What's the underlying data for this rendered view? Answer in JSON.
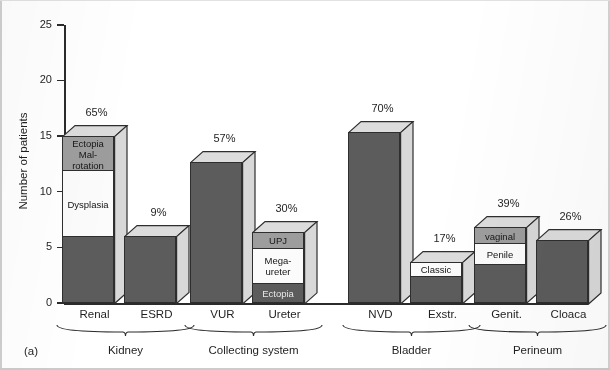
{
  "figure": {
    "panel_label": "(a)",
    "y_axis_title": "Number of patients",
    "y_ticks": [
      "0",
      "5",
      "10",
      "15",
      "20",
      "25"
    ]
  },
  "chart_data": {
    "type": "bar",
    "title": "",
    "subtitle": "",
    "xlabel": "",
    "ylabel": "Number of patients",
    "ylim": [
      0,
      25
    ],
    "ytick_values": [
      0,
      5,
      10,
      15,
      20,
      25
    ],
    "grid": false,
    "legend": "none",
    "style": "3d-stacked-bar",
    "panel": "(a)",
    "groups": [
      {
        "name": "Kidney",
        "categories": [
          "Renal",
          "ESRD"
        ]
      },
      {
        "name": "Collecting system",
        "categories": [
          "VUR",
          "Ureter"
        ]
      },
      {
        "name": "Bladder",
        "categories": [
          "NVD",
          "Exstr."
        ]
      },
      {
        "name": "Perineum",
        "categories": [
          "Genit.",
          "Cloaca"
        ]
      }
    ],
    "categories": [
      "Renal",
      "ESRD",
      "VUR",
      "Ureter",
      "NVD",
      "Exstr.",
      "Genit.",
      "Cloaca"
    ],
    "values": [
      15,
      6,
      12.7,
      6.4,
      15.4,
      3.7,
      6.8,
      5.7
    ],
    "percent_labels": [
      "65%",
      "9%",
      "57%",
      "30%",
      "70%",
      "17%",
      "39%",
      "26%"
    ],
    "bars": [
      {
        "category": "Renal",
        "group": "Kidney",
        "total": 15,
        "percent": "65%",
        "segments": [
          {
            "label": "",
            "value": 6,
            "from": 0,
            "to": 6,
            "fill": "dark"
          },
          {
            "label": "Dysplasia",
            "value": 6,
            "from": 6,
            "to": 12,
            "fill": "white"
          },
          {
            "label": "Ectopia\nMal-\nrotation",
            "value": 3,
            "from": 12,
            "to": 15,
            "fill": "gray"
          }
        ]
      },
      {
        "category": "ESRD",
        "group": "Kidney",
        "total": 6,
        "percent": "9%",
        "segments": [
          {
            "label": "",
            "value": 6,
            "from": 0,
            "to": 6,
            "fill": "dark"
          }
        ]
      },
      {
        "category": "VUR",
        "group": "Collecting system",
        "total": 12.7,
        "percent": "57%",
        "segments": [
          {
            "label": "",
            "value": 12.7,
            "from": 0,
            "to": 12.7,
            "fill": "dark"
          }
        ]
      },
      {
        "category": "Ureter",
        "group": "Collecting system",
        "total": 6.4,
        "percent": "30%",
        "segments": [
          {
            "label": "Ectopia",
            "value": 1.8,
            "from": 0,
            "to": 1.8,
            "fill": "dark"
          },
          {
            "label": "Mega-\nureter",
            "value": 3.2,
            "from": 1.8,
            "to": 5.0,
            "fill": "white"
          },
          {
            "label": "UPJ",
            "value": 1.4,
            "from": 5.0,
            "to": 6.4,
            "fill": "gray"
          }
        ]
      },
      {
        "category": "NVD",
        "group": "Bladder",
        "total": 15.4,
        "percent": "70%",
        "segments": [
          {
            "label": "",
            "value": 15.4,
            "from": 0,
            "to": 15.4,
            "fill": "dark"
          }
        ]
      },
      {
        "category": "Exstr.",
        "group": "Bladder",
        "total": 3.7,
        "percent": "17%",
        "segments": [
          {
            "label": "",
            "value": 2.5,
            "from": 0,
            "to": 2.5,
            "fill": "dark"
          },
          {
            "label": "Classic",
            "value": 1.2,
            "from": 2.5,
            "to": 3.7,
            "fill": "white"
          }
        ]
      },
      {
        "category": "Genit.",
        "group": "Perineum",
        "total": 6.8,
        "percent": "39%",
        "segments": [
          {
            "label": "",
            "value": 3.5,
            "from": 0,
            "to": 3.5,
            "fill": "dark"
          },
          {
            "label": "Penile",
            "value": 1.9,
            "from": 3.5,
            "to": 5.4,
            "fill": "white"
          },
          {
            "label": "vaginal",
            "value": 1.4,
            "from": 5.4,
            "to": 6.8,
            "fill": "gray"
          }
        ]
      },
      {
        "category": "Cloaca",
        "group": "Perineum",
        "total": 5.7,
        "percent": "26%",
        "segments": [
          {
            "label": "",
            "value": 5.7,
            "from": 0,
            "to": 5.7,
            "fill": "dark"
          }
        ]
      }
    ],
    "colors": {
      "dark_segment": "#5c5c5c",
      "white_segment": "#fbfbfb",
      "gray_segment": "#9d9d9d",
      "bar_side": "#d8d8d8",
      "bar_top": "#dcdcdc",
      "axis": "#2b2b2b",
      "background": "#ffffff"
    }
  }
}
